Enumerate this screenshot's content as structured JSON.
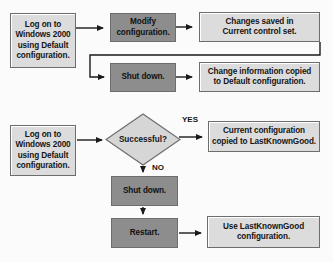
{
  "diagram": {
    "type": "flowchart",
    "colors": {
      "light_fill": "#dcdcdc",
      "dark_fill": "#8d8d8d",
      "border": "#6d6d6d",
      "line": "#1a1a1a",
      "background": "#fbfbfb",
      "text": "#151515"
    }
  },
  "flow_top": {
    "start": {
      "line1": "Log on to",
      "line2": "Windows 2000",
      "line3": "using Default",
      "line4": "configuration.",
      "style": "light"
    },
    "modify": {
      "line1": "Modify",
      "line2": "configuration.",
      "style": "dark"
    },
    "saved": {
      "line1": "Changes saved in",
      "line2": "Current control set.",
      "style": "light"
    },
    "shutdown": {
      "line1": "Shut down.",
      "style": "dark"
    },
    "copied": {
      "line1": "Change information copied",
      "line2": "to Default configuration.",
      "style": "light"
    }
  },
  "flow_bottom": {
    "start": {
      "line1": "Log on to",
      "line2": "Windows 2000",
      "line3": "using Default",
      "line4": "configuration.",
      "style": "light"
    },
    "decision": {
      "label": "Successful?",
      "style": "light"
    },
    "yes_label": "YES",
    "no_label": "NO",
    "lastknowngood": {
      "line1": "Current configuration",
      "line2": "copied to LastKnownGood.",
      "style": "light"
    },
    "shutdown": {
      "line1": "Shut down.",
      "style": "dark"
    },
    "restart": {
      "line1": "Restart.",
      "style": "dark"
    },
    "use_lkg": {
      "line1": "Use LastKnownGood",
      "line2": "configuration.",
      "style": "light"
    }
  }
}
